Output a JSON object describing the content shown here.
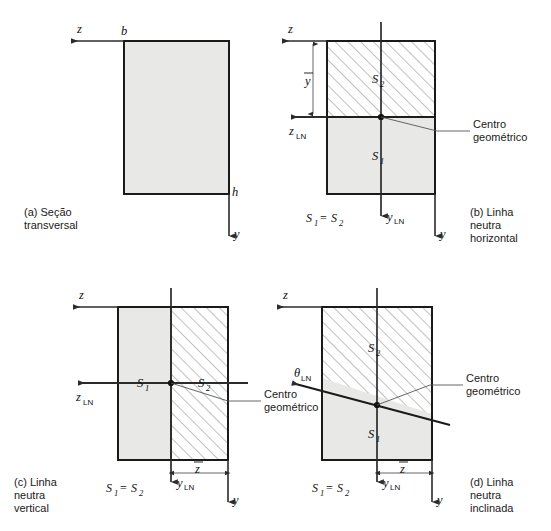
{
  "figure": {
    "background_color": "#ffffff",
    "outline_color": "#1a1a1a",
    "fill_gray": "#e8e8e6",
    "hatch_color": "#8c8c8c",
    "axis_color": "#2b2b2b"
  },
  "panels": [
    {
      "id": "a",
      "caption_lines": [
        "(a) Seção",
        "transversal"
      ],
      "labels": {
        "z_axis": "z",
        "y_axis": "y",
        "width": "b",
        "height": "h"
      }
    },
    {
      "id": "b",
      "caption_lines": [
        "(b) Linha",
        "neutra",
        "horizontal"
      ],
      "labels": {
        "z_axis": "z",
        "y_axis": "y",
        "z_neutral": "z",
        "z_neutral_sub": "LN",
        "y_neutral": "y",
        "y_neutral_sub": "LN",
        "area_top": "S",
        "area_top_sub": "2",
        "area_bottom": "S",
        "area_bottom_sub": "1",
        "dimension": "y",
        "centroid_callout": [
          "Centro",
          "geométrico"
        ],
        "equality": "S₁ = S₂"
      }
    },
    {
      "id": "c",
      "caption_lines": [
        "(c) Linha",
        "neutra",
        "vertical"
      ],
      "labels": {
        "z_axis": "z",
        "y_axis": "y",
        "z_neutral": "z",
        "z_neutral_sub": "LN",
        "y_neutral": "y",
        "y_neutral_sub": "LN",
        "area_left": "S",
        "area_left_sub": "1",
        "area_right": "S",
        "area_right_sub": "2",
        "dimension": "z",
        "centroid_callout": [
          "Centro",
          "geométrico"
        ],
        "equality": "S₁ = S₂"
      }
    },
    {
      "id": "d",
      "caption_lines": [
        "(d) Linha",
        "neutra",
        "inclinada"
      ],
      "labels": {
        "z_axis": "z",
        "y_axis": "y",
        "theta_neutral": "θ",
        "theta_neutral_sub": "LN",
        "y_neutral": "y",
        "y_neutral_sub": "LN",
        "area_top": "S",
        "area_top_sub": "2",
        "area_bottom": "S",
        "area_bottom_sub": "1",
        "dimension": "z",
        "centroid_callout": [
          "Centro",
          "geométrico"
        ],
        "equality": "S₁ = S₂"
      }
    }
  ],
  "equality_parts": {
    "s": "S",
    "one": "1",
    "two": "2",
    "equals": "="
  }
}
